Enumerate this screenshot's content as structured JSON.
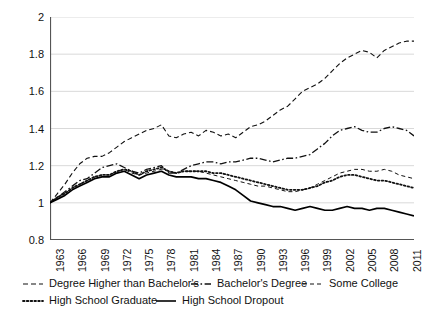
{
  "chart_data": {
    "type": "line",
    "title": "",
    "subtitle": "",
    "xlabel": "",
    "ylabel": "",
    "xlim": [
      1963,
      2012
    ],
    "ylim": [
      0.8,
      2.0
    ],
    "ytick_values": [
      0.8,
      1,
      1.2,
      1.4,
      1.6,
      1.8,
      2
    ],
    "ytick_labels": [
      "0.8",
      "1",
      "1.2",
      "1.4",
      "1.6",
      "1.8",
      "2"
    ],
    "xtick_labels": [
      "1963",
      "1966",
      "1969",
      "1972",
      "1975",
      "1978",
      "1981",
      "1984",
      "1987",
      "1990",
      "1993",
      "1996",
      "1999",
      "2002",
      "2005",
      "2008",
      "2011"
    ],
    "xtick_values": [
      1963,
      1966,
      1969,
      1972,
      1975,
      1978,
      1981,
      1984,
      1987,
      1990,
      1993,
      1996,
      1999,
      2002,
      2005,
      2008,
      2011
    ],
    "grid": "horizontal",
    "legend_position": "below",
    "x": [
      1963,
      1964,
      1965,
      1966,
      1967,
      1968,
      1969,
      1970,
      1971,
      1972,
      1973,
      1974,
      1975,
      1976,
      1977,
      1978,
      1979,
      1980,
      1981,
      1982,
      1983,
      1984,
      1985,
      1986,
      1987,
      1988,
      1989,
      1990,
      1991,
      1992,
      1993,
      1994,
      1995,
      1996,
      1997,
      1998,
      1999,
      2000,
      2001,
      2002,
      2003,
      2004,
      2005,
      2006,
      2007,
      2008,
      2009,
      2010,
      2011,
      2012
    ],
    "series": [
      {
        "name": "Degree Higher than Bachelor's",
        "line_style": "dashed",
        "color": "#111111",
        "values": [
          1.0,
          1.05,
          1.1,
          1.16,
          1.21,
          1.24,
          1.25,
          1.25,
          1.27,
          1.3,
          1.33,
          1.35,
          1.37,
          1.39,
          1.4,
          1.42,
          1.36,
          1.35,
          1.37,
          1.38,
          1.36,
          1.39,
          1.38,
          1.36,
          1.37,
          1.35,
          1.38,
          1.41,
          1.42,
          1.44,
          1.47,
          1.5,
          1.52,
          1.56,
          1.6,
          1.62,
          1.64,
          1.67,
          1.71,
          1.75,
          1.78,
          1.8,
          1.82,
          1.81,
          1.78,
          1.82,
          1.84,
          1.86,
          1.87,
          1.87
        ]
      },
      {
        "name": "Bachelor's Degree",
        "line_style": "dashdot",
        "color": "#111111",
        "values": [
          1.0,
          1.03,
          1.06,
          1.09,
          1.12,
          1.13,
          1.16,
          1.19,
          1.2,
          1.21,
          1.19,
          1.17,
          1.16,
          1.18,
          1.19,
          1.2,
          1.16,
          1.16,
          1.18,
          1.2,
          1.21,
          1.22,
          1.22,
          1.21,
          1.22,
          1.22,
          1.23,
          1.24,
          1.24,
          1.23,
          1.22,
          1.23,
          1.24,
          1.24,
          1.25,
          1.26,
          1.29,
          1.32,
          1.36,
          1.39,
          1.4,
          1.41,
          1.39,
          1.38,
          1.38,
          1.4,
          1.41,
          1.4,
          1.39,
          1.36
        ]
      },
      {
        "name": "Some College",
        "line_style": "dashed-short",
        "color": "#111111",
        "values": [
          1.0,
          1.03,
          1.05,
          1.08,
          1.1,
          1.12,
          1.14,
          1.15,
          1.15,
          1.17,
          1.18,
          1.16,
          1.15,
          1.16,
          1.17,
          1.18,
          1.17,
          1.16,
          1.17,
          1.17,
          1.17,
          1.16,
          1.15,
          1.14,
          1.13,
          1.12,
          1.11,
          1.1,
          1.09,
          1.09,
          1.08,
          1.07,
          1.06,
          1.06,
          1.07,
          1.08,
          1.1,
          1.12,
          1.14,
          1.16,
          1.17,
          1.18,
          1.18,
          1.17,
          1.17,
          1.18,
          1.17,
          1.15,
          1.14,
          1.13
        ]
      },
      {
        "name": "High School Graduate",
        "line_style": "dotted",
        "color": "#111111",
        "values": [
          1.0,
          1.03,
          1.05,
          1.08,
          1.1,
          1.12,
          1.14,
          1.15,
          1.15,
          1.17,
          1.18,
          1.17,
          1.15,
          1.17,
          1.18,
          1.19,
          1.17,
          1.16,
          1.17,
          1.17,
          1.17,
          1.17,
          1.16,
          1.16,
          1.15,
          1.14,
          1.13,
          1.12,
          1.11,
          1.1,
          1.09,
          1.08,
          1.07,
          1.07,
          1.07,
          1.08,
          1.09,
          1.11,
          1.12,
          1.14,
          1.15,
          1.15,
          1.14,
          1.13,
          1.12,
          1.12,
          1.11,
          1.1,
          1.09,
          1.08
        ]
      },
      {
        "name": "High School Dropout",
        "line_style": "solid",
        "color": "#000000",
        "values": [
          1.0,
          1.02,
          1.04,
          1.07,
          1.09,
          1.11,
          1.13,
          1.14,
          1.14,
          1.16,
          1.17,
          1.15,
          1.13,
          1.15,
          1.16,
          1.17,
          1.15,
          1.14,
          1.14,
          1.14,
          1.13,
          1.13,
          1.12,
          1.11,
          1.09,
          1.07,
          1.04,
          1.01,
          1.0,
          0.99,
          0.98,
          0.98,
          0.97,
          0.96,
          0.97,
          0.98,
          0.97,
          0.96,
          0.96,
          0.97,
          0.98,
          0.97,
          0.97,
          0.96,
          0.97,
          0.97,
          0.96,
          0.95,
          0.94,
          0.93
        ]
      }
    ]
  },
  "legend": {
    "rows": [
      [
        {
          "label": "Degree Higher than Bachelor's",
          "style": "dashed"
        },
        {
          "label": "Bachelor's Degree",
          "style": "dashdot"
        },
        {
          "label": "Some College",
          "style": "dashed-short"
        }
      ],
      [
        {
          "label": "High School Graduate",
          "style": "dotted"
        },
        {
          "label": "High School Dropout",
          "style": "solid"
        }
      ]
    ]
  }
}
